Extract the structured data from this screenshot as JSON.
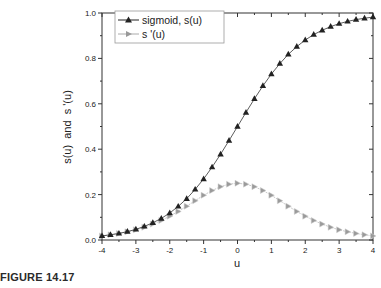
{
  "caption": "FIGURE 14.17",
  "chart_data": {
    "type": "line",
    "title": "",
    "xlabel": "u",
    "ylabel": "s(u)  and  s '(u)",
    "xlim": [
      -4,
      4
    ],
    "ylim": [
      0.0,
      1.0
    ],
    "xticks": [
      "-4",
      "-3",
      "-2",
      "-1",
      "0",
      "1",
      "2",
      "3",
      "4"
    ],
    "yticks": [
      "0.0",
      "0.2",
      "0.4",
      "0.6",
      "0.8",
      "1.0"
    ],
    "grid": false,
    "legend_position": "upper-left",
    "x": [
      -4,
      -3.75,
      -3.5,
      -3.25,
      -3,
      -2.75,
      -2.5,
      -2.25,
      -2,
      -1.75,
      -1.5,
      -1.25,
      -1,
      -0.75,
      -0.5,
      -0.25,
      0,
      0.25,
      0.5,
      0.75,
      1,
      1.25,
      1.5,
      1.75,
      2,
      2.25,
      2.5,
      2.75,
      3,
      3.25,
      3.5,
      3.75,
      4
    ],
    "series": [
      {
        "name": "sigmoid, s(u)",
        "marker": "filled-up-triangle",
        "color": "#222222",
        "values": [
          0.018,
          0.023,
          0.029,
          0.037,
          0.047,
          0.06,
          0.076,
          0.095,
          0.119,
          0.148,
          0.182,
          0.223,
          0.269,
          0.321,
          0.378,
          0.438,
          0.5,
          0.562,
          0.622,
          0.679,
          0.731,
          0.777,
          0.818,
          0.852,
          0.881,
          0.905,
          0.924,
          0.94,
          0.953,
          0.963,
          0.971,
          0.977,
          0.982
        ]
      },
      {
        "name": "s '(u)",
        "marker": "right-triangle",
        "color": "#9a9a9a",
        "values": [
          0.018,
          0.023,
          0.029,
          0.036,
          0.045,
          0.056,
          0.07,
          0.086,
          0.105,
          0.126,
          0.149,
          0.173,
          0.197,
          0.218,
          0.235,
          0.246,
          0.25,
          0.246,
          0.235,
          0.218,
          0.197,
          0.173,
          0.149,
          0.126,
          0.105,
          0.086,
          0.07,
          0.056,
          0.045,
          0.036,
          0.029,
          0.023,
          0.018
        ]
      }
    ]
  }
}
